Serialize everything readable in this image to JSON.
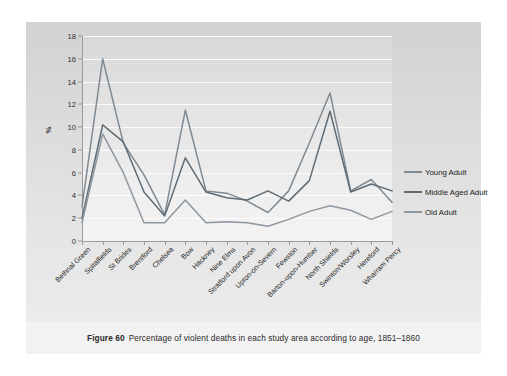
{
  "figure": {
    "caption_label": "Figure 60",
    "caption_text": "Percentage of violent deaths in each study area according to age, 1851–1860"
  },
  "legend": {
    "position": "right",
    "items": [
      {
        "label": "Young Adult",
        "color": "#7f8a93"
      },
      {
        "label": "Middle Aged Adult",
        "color": "#5f6b74"
      },
      {
        "label": "Old Adult",
        "color": "#8d97a0"
      }
    ]
  },
  "chart_data": {
    "type": "line",
    "title": "",
    "xlabel": "",
    "ylabel": "%",
    "ylim": [
      0,
      18
    ],
    "ytick_step": 2,
    "yticks": [
      0,
      2,
      4,
      6,
      8,
      10,
      12,
      14,
      16,
      18
    ],
    "grid": true,
    "categories": [
      "Bethnal Green",
      "Spitalfields",
      "St Brides",
      "Brentford",
      "Chelsea",
      "Bow",
      "Hackney",
      "Nine Elms",
      "Stratford upon Avon",
      "Upton-on-Severn",
      "Fewston",
      "Barton-upon-Humber",
      "North Shields",
      "Swinton/Worsley",
      "Hereford",
      "Wharram Percy"
    ],
    "series": [
      {
        "name": "Young Adult",
        "color": "#7f8a93",
        "values": [
          3.0,
          16.0,
          8.6,
          5.8,
          2.3,
          11.5,
          4.4,
          4.2,
          3.5,
          2.5,
          4.4,
          8.6,
          13.0,
          4.4,
          5.4,
          3.4
        ]
      },
      {
        "name": "Middle Aged Adult",
        "color": "#5f6b74",
        "values": [
          2.0,
          10.2,
          8.7,
          4.3,
          2.2,
          7.3,
          4.3,
          3.8,
          3.6,
          4.4,
          3.5,
          5.3,
          11.4,
          4.3,
          5.0,
          4.4
        ]
      },
      {
        "name": "Old Adult",
        "color": "#8d97a0",
        "values": [
          1.6,
          9.4,
          6.0,
          1.6,
          1.6,
          3.6,
          1.6,
          1.7,
          1.6,
          1.3,
          1.9,
          2.6,
          3.1,
          2.7,
          1.9,
          2.6
        ]
      }
    ]
  }
}
